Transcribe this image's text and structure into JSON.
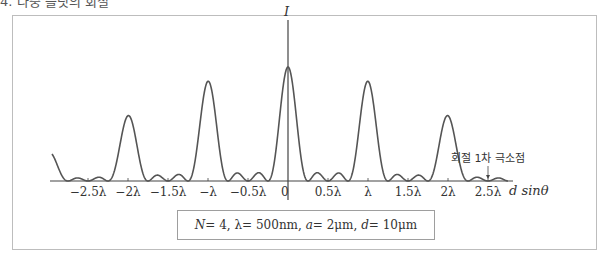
{
  "header": {
    "cut_off_text": "4. 다중 슬릿의 회절"
  },
  "chart_data": {
    "type": "line",
    "title": "",
    "xlabel": "d sinθ",
    "ylabel": "I",
    "x_tick_labels": [
      "−2.5λ",
      "−2λ",
      "−1.5λ",
      "−λ",
      "−0.5λ",
      "0",
      "0.5λ",
      "λ",
      "1.5λ",
      "2λ",
      "2.5λ"
    ],
    "x_tick_values_lambda": [
      -2.5,
      -2,
      -1.5,
      -1,
      -0.5,
      0,
      0.5,
      1,
      1.5,
      2,
      2.5
    ],
    "xlim_lambda": [
      -2.95,
      2.75
    ],
    "params": {
      "N": 4,
      "wavelength_nm": 500,
      "a_um": 2,
      "d_um": 10
    },
    "principal_maxima": {
      "x_lambda": [
        -2,
        -1.5,
        -1,
        -0.5,
        0,
        0.5,
        1,
        1.5,
        2
      ],
      "relative_intensity": [
        0.05,
        0.26,
        0.58,
        0.88,
        1.0,
        0.88,
        0.58,
        0.26,
        0.05
      ]
    },
    "secondary_maxima_between_principal": 2,
    "annotation": {
      "text": "회절 1차 극소점",
      "x_lambda": 2.5
    },
    "grid": false,
    "legend_position": "bottom-center"
  },
  "legend": {
    "N_label": "N",
    "N_value": "= 4,",
    "lambda_label": "λ",
    "lambda_value": "= 500nm,",
    "a_label": "a",
    "a_value": "= 2μm,",
    "d_label": "d",
    "d_value": "= 10μm"
  }
}
